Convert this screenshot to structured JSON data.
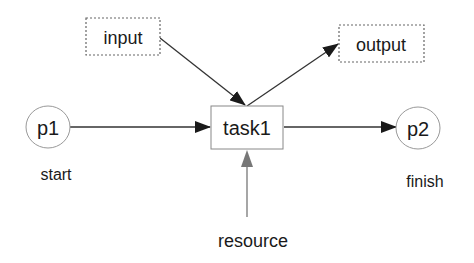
{
  "diagram": {
    "type": "petri-net",
    "colors": {
      "background": "#ffffff",
      "stroke": "#555555",
      "arrow": "#1a1a1a",
      "resource_arrow": "#777777",
      "text": "#1a1a1a",
      "dashed_border": "#666666",
      "circle_border": "#999999"
    },
    "nodes": {
      "input": {
        "label": "input",
        "shape": "dashed-rectangle"
      },
      "output": {
        "label": "output",
        "shape": "dashed-rectangle"
      },
      "task1": {
        "label": "task1",
        "shape": "rectangle"
      },
      "p1": {
        "label": "p1",
        "shape": "circle",
        "caption": "start"
      },
      "p2": {
        "label": "p2",
        "shape": "circle",
        "caption": "finish"
      },
      "resource": {
        "label": "resource",
        "shape": "text"
      }
    },
    "edges": [
      {
        "from": "p1",
        "to": "task1"
      },
      {
        "from": "input",
        "to": "task1"
      },
      {
        "from": "task1",
        "to": "output"
      },
      {
        "from": "task1",
        "to": "p2"
      },
      {
        "from": "resource",
        "to": "task1"
      }
    ]
  }
}
